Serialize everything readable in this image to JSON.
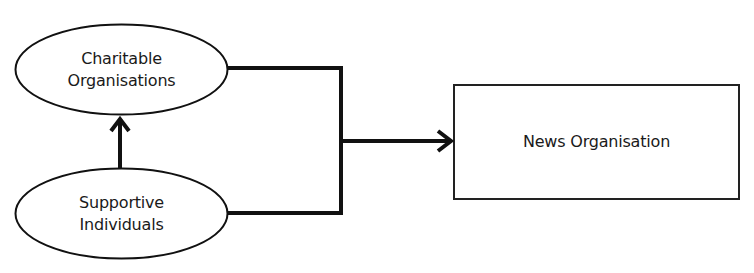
{
  "diagram": {
    "nodes": {
      "charitable": {
        "shape": "ellipse",
        "line1": "Charitable",
        "line2": "Organisations"
      },
      "supportive": {
        "shape": "ellipse",
        "line1": "Supportive",
        "line2": "Individuals"
      },
      "news": {
        "shape": "rectangle",
        "label": "News Organisation"
      }
    },
    "edges": [
      {
        "from": "Supportive Individuals",
        "to": "Charitable Organisations",
        "type": "arrow"
      },
      {
        "from": "Charitable Organisations",
        "to": "News Organisation",
        "type": "merged-arrow"
      },
      {
        "from": "Supportive Individuals",
        "to": "News Organisation",
        "type": "merged-arrow"
      }
    ],
    "colors": {
      "stroke": "#111111",
      "background": "#ffffff",
      "text": "#1a1a1a"
    }
  }
}
